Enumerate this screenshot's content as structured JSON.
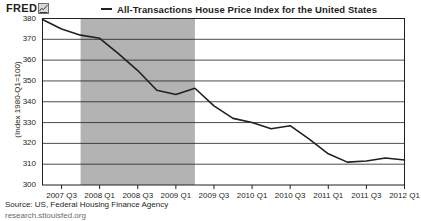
{
  "brand": {
    "name": "FRED",
    "icon": "mini-chart-icon"
  },
  "chart_data": {
    "type": "line",
    "title": "All-Transactions House Price Index for the United States",
    "xlabel": "",
    "ylabel": "(Index 1980-Q1=100)",
    "ylim": [
      300,
      380
    ],
    "yticks": [
      300,
      310,
      320,
      330,
      340,
      350,
      360,
      370,
      380
    ],
    "grid": true,
    "legend": [
      "All-Transactions House Price Index for the United States"
    ],
    "legend_position": "top",
    "categories": [
      "2007 Q2",
      "2007 Q3",
      "2007 Q4",
      "2008 Q1",
      "2008 Q2",
      "2008 Q3",
      "2008 Q4",
      "2009 Q1",
      "2009 Q2",
      "2009 Q3",
      "2009 Q4",
      "2010 Q1",
      "2010 Q2",
      "2010 Q3",
      "2010 Q4",
      "2011 Q1",
      "2011 Q2",
      "2011 Q3",
      "2011 Q4",
      "2012 Q1"
    ],
    "values": [
      379.5,
      375.0,
      372.0,
      370.5,
      363.0,
      355.0,
      345.5,
      343.5,
      346.5,
      338.0,
      332.0,
      330.0,
      327.0,
      328.5,
      322.0,
      315.0,
      311.0,
      311.5,
      313.0,
      312.0
    ],
    "xticks": [
      "2007 Q3",
      "2008 Q1",
      "2008 Q3",
      "2009 Q1",
      "2009 Q3",
      "2010 Q1",
      "2010 Q3",
      "2011 Q1",
      "2011 Q3",
      "2012 Q1"
    ],
    "recession_band": {
      "label": "recession-shading",
      "start": "2007 Q4",
      "end": "2009 Q2",
      "color": "#b3b3b3"
    },
    "line_color": "#231f20",
    "annotations": []
  },
  "footer": {
    "source": "Source: US, Federal Housing Finance Agency",
    "url": "research.stlouisfed.org"
  }
}
